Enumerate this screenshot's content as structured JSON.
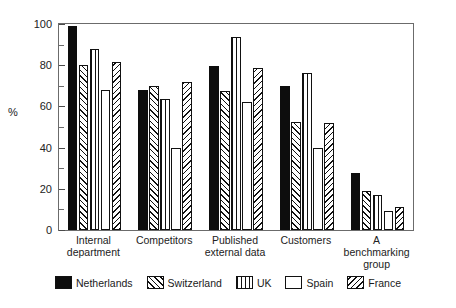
{
  "chart_data": {
    "type": "bar",
    "title": "",
    "subtitle": "",
    "xlabel": "",
    "ylabel": "%",
    "ylim": [
      0,
      100
    ],
    "yticks": [
      0,
      20,
      40,
      60,
      80,
      100
    ],
    "ytick_labels": [
      "0",
      "20",
      "40",
      "60",
      "80",
      "100"
    ],
    "grid": false,
    "legend_position": "bottom",
    "categories": [
      "Internal department",
      "Competitors",
      "Published external data",
      "Customers",
      "A benchmarking group"
    ],
    "category_lines": [
      [
        "Internal",
        "department"
      ],
      [
        "Competitors"
      ],
      [
        "Published",
        "external data"
      ],
      [
        "Customers"
      ],
      [
        "A",
        "benchmarking",
        "group"
      ]
    ],
    "series": [
      {
        "name": "Netherlands",
        "pattern": "solid-black",
        "values": [
          99,
          68,
          79.5,
          70,
          27.5
        ]
      },
      {
        "name": "Switzerland",
        "pattern": "diagonal-hatch",
        "values": [
          80,
          70,
          67.5,
          52.5,
          19
        ]
      },
      {
        "name": "UK",
        "pattern": "vertical-lines",
        "values": [
          88,
          63.5,
          93.5,
          76,
          17
        ]
      },
      {
        "name": "Spain",
        "pattern": "empty",
        "values": [
          68,
          40,
          62,
          40,
          9
        ]
      },
      {
        "name": "France",
        "pattern": "reverse-diagonal-hatch",
        "values": [
          81.5,
          72,
          78.5,
          52,
          11
        ]
      }
    ]
  },
  "legend": {
    "items": [
      {
        "label": "Netherlands"
      },
      {
        "label": "Switzerland"
      },
      {
        "label": "UK"
      },
      {
        "label": "Spain"
      },
      {
        "label": "France"
      }
    ]
  },
  "colors": {
    "axis": "#6b6b6b",
    "bar_outline": "#111111",
    "bar_fill_solid": "#0d0d0d",
    "background": "#ffffff",
    "text": "#1a1a1a"
  }
}
